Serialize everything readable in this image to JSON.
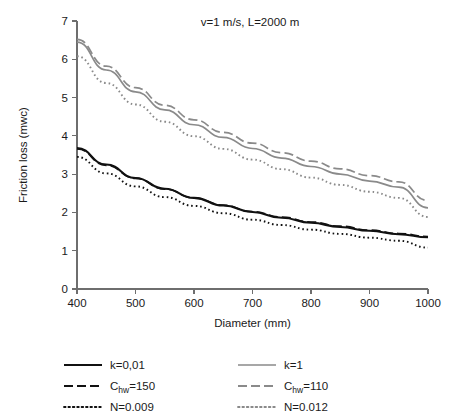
{
  "chart_data": {
    "type": "line",
    "title": "v=1 m/s, L=2000 m",
    "xlabel": "Diameter (mm)",
    "ylabel": "Friction loss (mwc)",
    "xlim": [
      400,
      1000
    ],
    "ylim": [
      0,
      7
    ],
    "xticks": [
      400,
      500,
      600,
      700,
      800,
      900,
      1000
    ],
    "yticks": [
      0,
      1,
      2,
      3,
      4,
      5,
      6,
      7
    ],
    "xtick_labels": [
      "400",
      "500",
      "600",
      "700",
      "800",
      "900",
      "1000"
    ],
    "ytick_labels": [
      "0",
      "1",
      "2",
      "3",
      "4",
      "5",
      "6",
      "7"
    ],
    "grid": false,
    "legend_position": "below",
    "x": [
      400,
      450,
      500,
      550,
      600,
      650,
      700,
      750,
      800,
      850,
      900,
      950,
      1000
    ],
    "series": [
      {
        "name": "k=0,01",
        "color": "#111111",
        "style": "solid",
        "width": 2.1,
        "values": [
          3.68,
          3.25,
          2.9,
          2.62,
          2.38,
          2.18,
          2.01,
          1.86,
          1.73,
          1.62,
          1.52,
          1.43,
          1.35
        ]
      },
      {
        "name": "Chw=150",
        "label_main": "C",
        "label_sub": "hw",
        "label_rest": "=150",
        "color": "#111111",
        "style": "dashed",
        "width": 1.7,
        "values": [
          3.66,
          3.23,
          2.89,
          2.61,
          2.38,
          2.19,
          2.02,
          1.88,
          1.75,
          1.64,
          1.54,
          1.45,
          1.37
        ]
      },
      {
        "name": "N=0.009",
        "color": "#111111",
        "style": "dotted",
        "width": 1.9,
        "values": [
          3.45,
          3.02,
          2.68,
          2.4,
          2.17,
          1.98,
          1.81,
          1.67,
          1.55,
          1.44,
          1.34,
          1.26,
          1.08
        ]
      },
      {
        "name": "k=1",
        "color": "#8a8a8a",
        "style": "solid",
        "width": 1.7,
        "values": [
          6.45,
          5.72,
          5.15,
          4.68,
          4.29,
          3.96,
          3.67,
          3.42,
          3.2,
          3.0,
          2.82,
          2.66,
          2.12
        ]
      },
      {
        "name": "Chw=110",
        "label_main": "C",
        "label_sub": "hw",
        "label_rest": "=110",
        "color": "#8a8a8a",
        "style": "dashed",
        "width": 1.7,
        "values": [
          6.52,
          5.82,
          5.26,
          4.8,
          4.42,
          4.09,
          3.81,
          3.56,
          3.34,
          3.14,
          2.96,
          2.8,
          2.31
        ]
      },
      {
        "name": "N=0.012",
        "color": "#8a8a8a",
        "style": "dotted",
        "width": 1.9,
        "values": [
          6.08,
          5.38,
          4.82,
          4.37,
          3.99,
          3.66,
          3.38,
          3.13,
          2.91,
          2.72,
          2.54,
          2.38,
          1.88
        ]
      }
    ]
  },
  "legend": {
    "entries": [
      {
        "label": "k=0,01",
        "main": "k=0,01",
        "sub": "",
        "rest": "",
        "color": "#111111",
        "style": "solid",
        "column": 0,
        "row": 0
      },
      {
        "label": "k=1",
        "main": "k=1",
        "sub": "",
        "rest": "",
        "color": "#8a8a8a",
        "style": "solid",
        "column": 1,
        "row": 0
      },
      {
        "label": "Chw=150",
        "main": "C",
        "sub": "hw",
        "rest": "=150",
        "color": "#111111",
        "style": "dashed",
        "column": 0,
        "row": 1
      },
      {
        "label": "Chw=110",
        "main": "C",
        "sub": "hw",
        "rest": "=110",
        "color": "#8a8a8a",
        "style": "dashed",
        "column": 1,
        "row": 1
      },
      {
        "label": "N=0.009",
        "main": "N=0.009",
        "sub": "",
        "rest": "",
        "color": "#111111",
        "style": "dotted",
        "column": 0,
        "row": 2
      },
      {
        "label": "N=0.012",
        "main": "N=0.012",
        "sub": "",
        "rest": "",
        "color": "#8a8a8a",
        "style": "dotted",
        "column": 1,
        "row": 2
      }
    ]
  }
}
